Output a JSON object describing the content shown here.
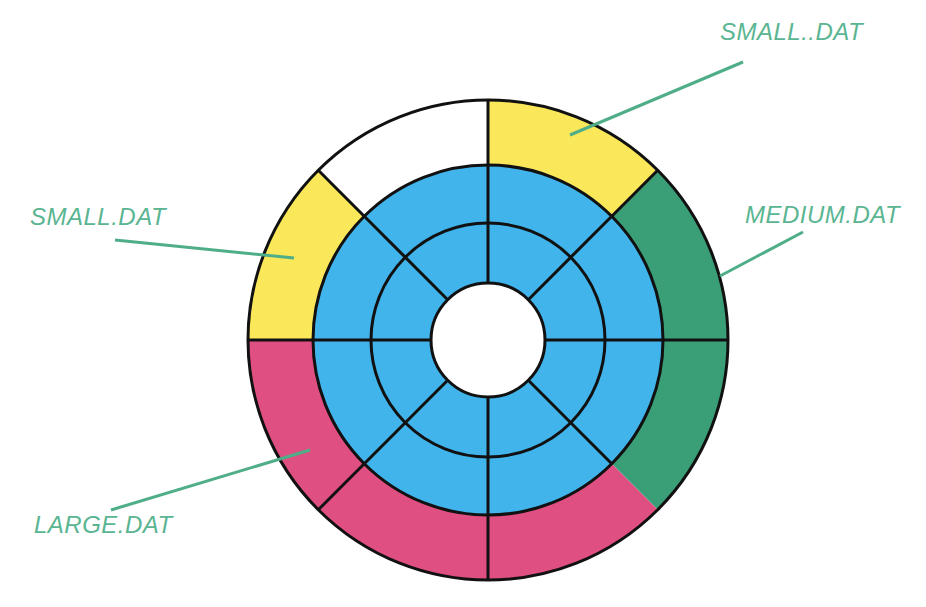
{
  "diagram": {
    "type": "disk-usage-ring",
    "center": {
      "x": 488,
      "y": 340
    },
    "radii": {
      "outer": 240,
      "blue_outer": 175,
      "blue_middle": 117,
      "hole": 57
    },
    "colors": {
      "blue": "#41b4ec",
      "yellow": "#fbe85a",
      "green": "#3a9e76",
      "pink": "#df4f82",
      "empty": "#ffffff",
      "stroke": "#111111",
      "label": "#5ab592",
      "leader": "#4fae88"
    },
    "outer_segments": [
      {
        "name": "segment-top-left",
        "start_deg": 270,
        "end_deg": 225,
        "fill": "empty"
      },
      {
        "name": "segment-top-right",
        "start_deg": 270,
        "end_deg": 315,
        "fill": "yellow"
      },
      {
        "name": "segment-right-upper",
        "start_deg": 315,
        "end_deg": 360,
        "fill": "green"
      },
      {
        "name": "segment-right-lower",
        "start_deg": 0,
        "end_deg": 45,
        "fill": "green"
      },
      {
        "name": "segment-bottom-right",
        "start_deg": 45,
        "end_deg": 90,
        "fill": "pink"
      },
      {
        "name": "segment-bottom-left",
        "start_deg": 90,
        "end_deg": 135,
        "fill": "pink"
      },
      {
        "name": "segment-left-lower",
        "start_deg": 135,
        "end_deg": 180,
        "fill": "pink"
      },
      {
        "name": "segment-left-upper",
        "start_deg": 180,
        "end_deg": 225,
        "fill": "yellow"
      }
    ],
    "labels": [
      {
        "id": "small-dat-2",
        "text": "SMALL..DAT",
        "x": 720,
        "y": 20,
        "leader": [
          [
            570,
            135
          ],
          [
            743,
            62
          ]
        ]
      },
      {
        "id": "small-dat",
        "text": "SMALL.DAT",
        "x": 30,
        "y": 205,
        "leader": [
          [
            294,
            258
          ],
          [
            115,
            240
          ]
        ]
      },
      {
        "id": "medium-dat",
        "text": "MEDIUM.DAT",
        "x": 745,
        "y": 203,
        "leader": [
          [
            720,
            276
          ],
          [
            803,
            232
          ]
        ]
      },
      {
        "id": "large-dat",
        "text": "LARGE.DAT",
        "x": 34,
        "y": 513,
        "leader": [
          [
            310,
            450
          ],
          [
            111,
            510
          ]
        ]
      }
    ]
  }
}
